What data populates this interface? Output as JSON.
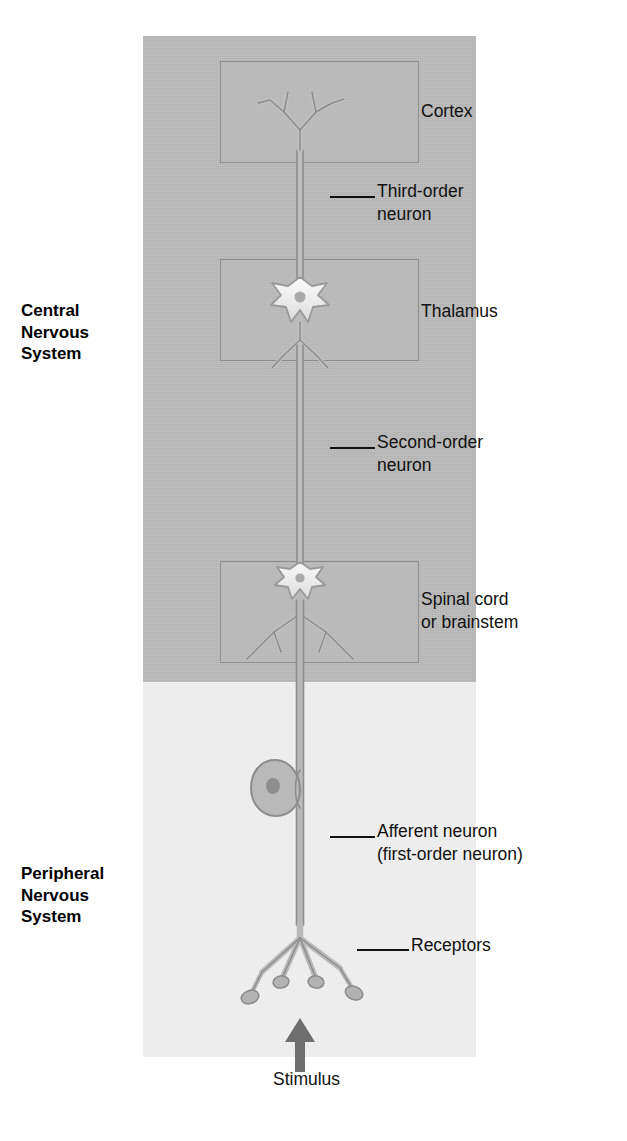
{
  "diagram": {
    "regions": [
      {
        "id": "cns",
        "label": "Central\nNervous\nSystem",
        "label_lines": [
          "Central",
          "Nervous",
          "System"
        ],
        "fill": "#b5b5b5"
      },
      {
        "id": "pns",
        "label": "Peripheral\nNervous\nSystem",
        "label_lines": [
          "Peripheral",
          "Nervous",
          "System"
        ],
        "fill": "#eeeeee"
      }
    ]
  },
  "left_labels": {
    "cns": {
      "line1": "Central",
      "line2": "Nervous",
      "line3": "System"
    },
    "pns": {
      "line1": "Peripheral",
      "line2": "Nervous",
      "line3": "System"
    }
  },
  "structures": {
    "cortex": {
      "label": "Cortex"
    },
    "thalamus": {
      "label": "Thalamus"
    },
    "spinal": {
      "line1": "Spinal cord",
      "line2": "or brainstem"
    }
  },
  "callouts": {
    "third_order": {
      "line1": "Third-order",
      "line2": "neuron"
    },
    "second_order": {
      "line1": "Second-order",
      "line2": "neuron"
    },
    "afferent": {
      "line1": "Afferent neuron",
      "line2": "(first-order neuron)"
    },
    "receptors": {
      "label": "Receptors"
    },
    "stimulus": {
      "label": "Stimulus"
    }
  },
  "colors": {
    "cns_fill": "#b5b5b5",
    "pns_fill": "#eeeeee",
    "box_stroke": "#8e8e8e",
    "neuron_stroke": "#8d8d8d",
    "neuron_fill": "#b9b9b9",
    "soma_light": "#f4f4f4",
    "nucleus": "#9a9a9a",
    "text": "#111111",
    "arrow": "#6e6e6e"
  }
}
